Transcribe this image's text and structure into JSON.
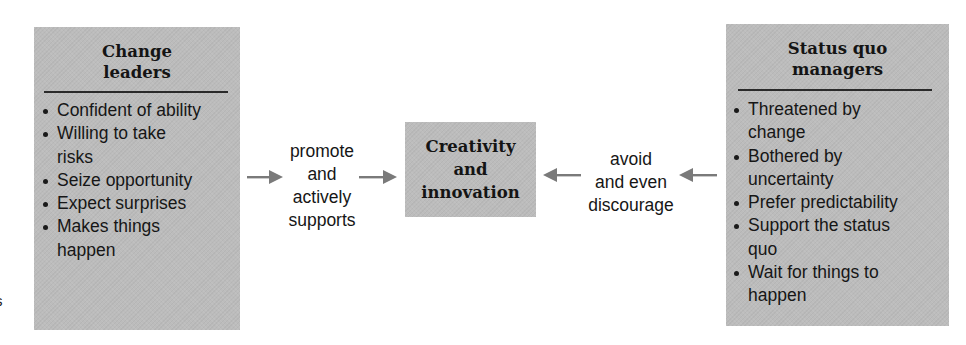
{
  "diagram": {
    "left_box": {
      "title_lines": [
        "Change",
        "leaders"
      ],
      "items": [
        {
          "lines": [
            "Confident of ability"
          ]
        },
        {
          "lines": [
            "Willing to take",
            "risks"
          ]
        },
        {
          "lines": [
            "Seize opportunity"
          ]
        },
        {
          "lines": [
            "Expect surprises"
          ]
        },
        {
          "lines": [
            "Makes things",
            "happen"
          ]
        }
      ]
    },
    "left_label": {
      "lines": [
        "promote",
        "and",
        "actively",
        "supports"
      ]
    },
    "center_box": {
      "title_lines": [
        "Creativity",
        "and",
        "innovation"
      ]
    },
    "right_label": {
      "lines": [
        "avoid",
        "and even",
        "discourage"
      ]
    },
    "right_box": {
      "title_lines": [
        "Status quo",
        "managers"
      ],
      "items": [
        {
          "lines": [
            "Threatened by",
            "change"
          ]
        },
        {
          "lines": [
            "Bothered by",
            "uncertainty"
          ]
        },
        {
          "lines": [
            "Prefer predictability"
          ]
        },
        {
          "lines": [
            "Support the status",
            "quo"
          ]
        },
        {
          "lines": [
            "Wait for things to",
            "happen"
          ]
        }
      ]
    },
    "edge_fragment": "s",
    "colors": {
      "box_fill": "#bcbcbc",
      "arrow": "#7a7a7a",
      "text": "#161616",
      "background": "#ffffff"
    }
  }
}
